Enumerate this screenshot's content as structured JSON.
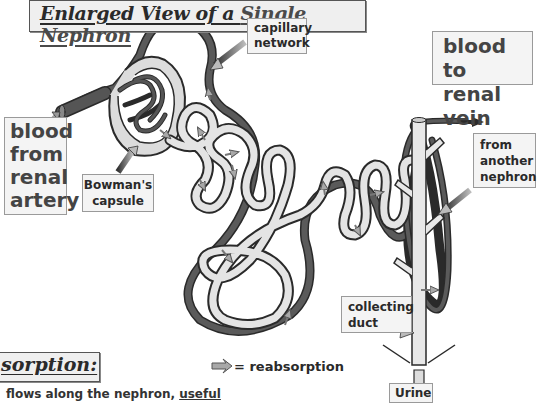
{
  "title": {
    "prefix": "Enlarged View of a ",
    "highlight": "Single Nephron"
  },
  "labels": {
    "blood_from_artery": [
      "blood",
      "from",
      "renal",
      "artery"
    ],
    "bowmans_capsule": [
      "Bowman's",
      "capsule"
    ],
    "capillary_network": [
      "capillary",
      "network"
    ],
    "blood_to_vein": [
      "blood to",
      "renal vein"
    ],
    "from_another_nephron": [
      "from",
      "another",
      "nephron"
    ],
    "collecting_duct": [
      "collecting",
      "duct"
    ],
    "urine": "Urine"
  },
  "section": {
    "heading": "sorption:",
    "body_line1_plain": " flows along the nephron, ",
    "body_line1_underlined": "useful",
    "body_line2": "are absorbed back into the blood"
  },
  "legend": {
    "symbol": "reabsorption-arrow-icon",
    "text": "= reabsorption"
  },
  "colors": {
    "blood_vessel": "#555555",
    "tubule_fill": "#e4e4e4",
    "outline": "#2a2a2a",
    "arrow_fill": "#a8a8a8",
    "label_bg": "#f4f4f4"
  }
}
